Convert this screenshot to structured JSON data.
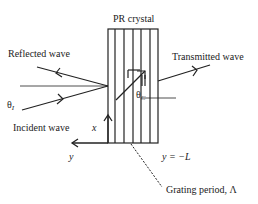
{
  "diagram": {
    "title": "PR crystal",
    "labels": {
      "reflected": "Reflected wave",
      "transmitted": "Transmitted wave",
      "incident": "Incident wave",
      "theta_i": "θ",
      "theta_i_sub": "I",
      "theta_c": "θ",
      "theta_c_sub": "C",
      "x_axis": "x",
      "y_axis": "y",
      "boundary": "y = −L",
      "grating": "Grating period, Λ"
    },
    "colors": {
      "stroke": "#222222",
      "background": "#ffffff"
    }
  }
}
